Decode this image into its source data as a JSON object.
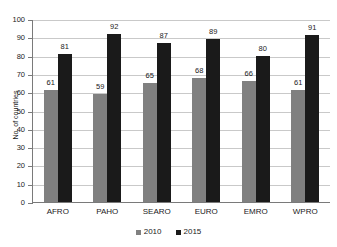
{
  "chart_data": {
    "type": "bar",
    "title": "",
    "xlabel": "",
    "ylabel": "No. of countries",
    "ylim": [
      0,
      100
    ],
    "yticks": [
      0,
      10,
      20,
      30,
      40,
      50,
      60,
      70,
      80,
      90,
      100
    ],
    "grid": true,
    "legend_position": "bottom",
    "categories": [
      "AFRO",
      "PAHO",
      "SEARO",
      "EURO",
      "EMRO",
      "WPRO"
    ],
    "series": [
      {
        "name": "2010",
        "color": "#808080",
        "values": [
          61,
          59,
          65,
          68,
          66,
          61
        ]
      },
      {
        "name": "2015",
        "color": "#1a1a1a",
        "values": [
          81,
          92,
          87,
          89,
          80,
          91
        ]
      }
    ]
  }
}
